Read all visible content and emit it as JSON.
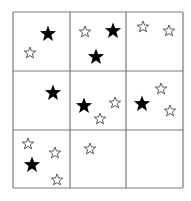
{
  "grid": {
    "rows": 3,
    "cols": 3,
    "x_lines": [
      13,
      70,
      126,
      183
    ],
    "y_lines": [
      12,
      71,
      130,
      188
    ],
    "line_color": "#7a7a7a",
    "line_width": 1.2
  },
  "colors": {
    "filled_star": "#000000",
    "outline_star_stroke": "#333333",
    "outline_star_fill": "#ffffff",
    "background": "#ffffff"
  },
  "cells": [
    {
      "row": 0,
      "col": 0,
      "stars": [
        {
          "type": "filled",
          "x": 48,
          "y": 34,
          "r": 8.5
        },
        {
          "type": "outline",
          "x": 30,
          "y": 53,
          "r": 6
        }
      ]
    },
    {
      "row": 0,
      "col": 1,
      "stars": [
        {
          "type": "outline",
          "x": 85,
          "y": 32,
          "r": 6
        },
        {
          "type": "filled",
          "x": 113,
          "y": 31,
          "r": 8.5
        },
        {
          "type": "filled",
          "x": 96,
          "y": 57,
          "r": 8.5
        }
      ]
    },
    {
      "row": 0,
      "col": 2,
      "stars": [
        {
          "type": "outline",
          "x": 143,
          "y": 27,
          "r": 6
        },
        {
          "type": "outline",
          "x": 169,
          "y": 31,
          "r": 6
        }
      ]
    },
    {
      "row": 1,
      "col": 0,
      "stars": [
        {
          "type": "filled",
          "x": 53,
          "y": 93,
          "r": 8.5
        }
      ]
    },
    {
      "row": 1,
      "col": 1,
      "stars": [
        {
          "type": "filled",
          "x": 84,
          "y": 106,
          "r": 8.5
        },
        {
          "type": "outline",
          "x": 115,
          "y": 103,
          "r": 6
        },
        {
          "type": "outline",
          "x": 100,
          "y": 119,
          "r": 6
        }
      ]
    },
    {
      "row": 1,
      "col": 2,
      "stars": [
        {
          "type": "filled",
          "x": 142,
          "y": 104,
          "r": 8.5
        },
        {
          "type": "outline",
          "x": 161,
          "y": 89,
          "r": 6
        },
        {
          "type": "outline",
          "x": 170,
          "y": 111,
          "r": 6
        }
      ]
    },
    {
      "row": 2,
      "col": 0,
      "stars": [
        {
          "type": "outline",
          "x": 28,
          "y": 144,
          "r": 6
        },
        {
          "type": "outline",
          "x": 55,
          "y": 153,
          "r": 6
        },
        {
          "type": "filled",
          "x": 32,
          "y": 165,
          "r": 8.5
        },
        {
          "type": "outline",
          "x": 57,
          "y": 180,
          "r": 6
        }
      ]
    },
    {
      "row": 2,
      "col": 1,
      "stars": [
        {
          "type": "outline",
          "x": 90,
          "y": 149,
          "r": 6
        }
      ]
    },
    {
      "row": 2,
      "col": 2,
      "stars": []
    }
  ]
}
